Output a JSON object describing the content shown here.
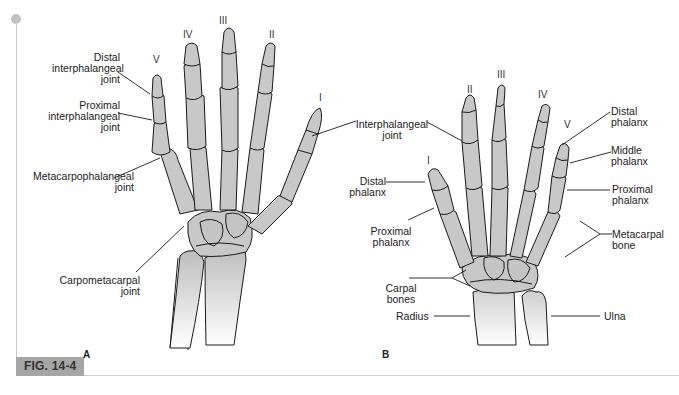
{
  "figure": {
    "number_label": "FIG. 14-4",
    "bone_color": "#c8c8c8",
    "outline_color": "#1a1a1a",
    "label_color": "#222222",
    "tab_color": "#a6a6a6"
  },
  "panel_a": {
    "letter": "A",
    "finger_numerals": {
      "I": "I",
      "II": "II",
      "III": "III",
      "IV": "IV",
      "V": "V"
    },
    "labels": {
      "distal_ip": [
        "Distal",
        "interphalangeal",
        "joint"
      ],
      "proximal_ip": [
        "Proximal",
        "interphalangeal",
        "joint"
      ],
      "mcp": [
        "Metacarpophalangeal",
        "joint"
      ],
      "cmc": [
        "Carpometacarpal",
        "joint"
      ],
      "ip": [
        "Interphalangeal",
        "joint"
      ]
    }
  },
  "panel_b": {
    "letter": "B",
    "finger_numerals": {
      "I": "I",
      "II": "II",
      "III": "III",
      "IV": "IV",
      "V": "V"
    },
    "labels": {
      "distal_phalanx_thumb": [
        "Distal",
        "phalanx"
      ],
      "proximal_phalanx_thumb": [
        "Proximal",
        "phalanx"
      ],
      "carpal_bones": [
        "Carpal",
        "bones"
      ],
      "radius": "Radius",
      "ulna": "Ulna",
      "distal_phalanx": [
        "Distal",
        "phalanx"
      ],
      "middle_phalanx": [
        "Middle",
        "phalanx"
      ],
      "proximal_phalanx": [
        "Proximal",
        "phalanx"
      ],
      "metacarpal_bone": [
        "Metacarpal",
        "bone"
      ]
    }
  }
}
